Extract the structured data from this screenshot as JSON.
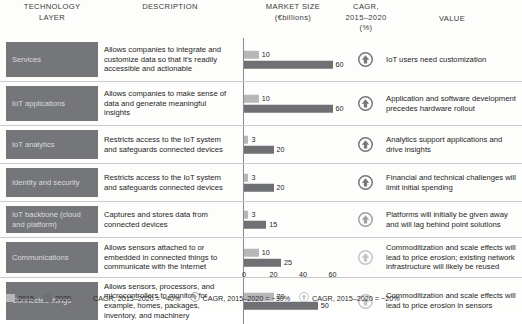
{
  "headers": {
    "layer": "TECHNOLOGY",
    "layer_sub": "LAYER",
    "description": "DESCRIPTION",
    "market": "MARKET SIZE",
    "market_sub": "(€billions)",
    "cagr": "CAGR,",
    "cagr_sub1": "2015–2020",
    "cagr_sub2": "(%)",
    "value": "VALUE"
  },
  "axis": {
    "ticks": [
      "0",
      "20",
      "40",
      "60"
    ],
    "max": 65
  },
  "legend": {
    "y2015": "2015",
    "y2020": "2020",
    "cagr40": "CAGR, 2015–2020 = ~40%",
    "cagr30": "CAGR, 2015–2020 = ~30%",
    "cagr20": "CAGR, 2015–2020 = ~20%"
  },
  "colors": {
    "bar_2015": "#b6b7b9",
    "bar_2020": "#6f7073",
    "chip_bg": "#75767a",
    "chip_text": "#d9dadd",
    "icon_40": "#76777b",
    "icon_30": "#a0a1a4",
    "icon_20": "#c3c4c6"
  },
  "rows": [
    {
      "layer": "Services",
      "description": "Allows companies to integrate and customize data so that it's readily accessible and actionable",
      "v2015": 10,
      "v2020": 60,
      "cagr_band": 40,
      "value": "IoT users need customization"
    },
    {
      "layer": "IoT applications",
      "description": "Allows companies to make sense of data and generate meaningful insights",
      "v2015": 10,
      "v2020": 60,
      "cagr_band": 40,
      "value": "Application and software development precedes hardware rollout"
    },
    {
      "layer": "IoT analytics",
      "description": "Restricts access to the IoT system and safeguards connected devices",
      "v2015": 3,
      "v2020": 20,
      "cagr_band": 40,
      "value": "Analytics support applications and drive insights"
    },
    {
      "layer": "Identity and security",
      "description": "Restricts access to the IoT system and safeguards connected devices",
      "v2015": 3,
      "v2020": 20,
      "cagr_band": 40,
      "value": "Financial and technical challenges will limit initial spending"
    },
    {
      "layer": "IoT backbone (cloud and platform)",
      "description": "Captures and stores data from connected devices",
      "v2015": 3,
      "v2020": 15,
      "cagr_band": 30,
      "value": "Platforms will initially be given away and will lag behind point solutions"
    },
    {
      "layer": "Communications",
      "description": "Allows sensors attached to or embedded in connected things to communicate with the internet",
      "v2015": 10,
      "v2020": 25,
      "cagr_band": 20,
      "value": "Commoditization and scale effects will lead to price erosion; existing network infrastructure will likely be reused"
    },
    {
      "layer": "Connected things",
      "description": "Allows sensors, processors, and microcontrollers to monitor, for example, homes, packages, inventory, and machinery",
      "v2015": 20,
      "v2020": 50,
      "cagr_band": 20,
      "value": "Commoditization and scale effects will lead to price erosion in sensors"
    }
  ],
  "chart_data": {
    "type": "bar",
    "xlabel": "Market size (€ billions)",
    "ylabel": "Technology layer",
    "xlim": [
      0,
      65
    ],
    "xticks": [
      0,
      20,
      40,
      60
    ],
    "grid": false,
    "legend_position": "bottom-left",
    "categories": [
      "Services",
      "IoT applications",
      "IoT analytics",
      "Identity and security",
      "IoT backbone (cloud and platform)",
      "Communications",
      "Connected things"
    ],
    "series": [
      {
        "name": "2015",
        "values": [
          10,
          10,
          3,
          3,
          3,
          10,
          20
        ],
        "color": "#b6b7b9"
      },
      {
        "name": "2020",
        "values": [
          60,
          60,
          20,
          20,
          15,
          25,
          50
        ],
        "color": "#6f7073"
      }
    ],
    "annotations": {
      "cagr_2015_2020_pct": [
        40,
        40,
        40,
        40,
        30,
        20,
        20
      ]
    }
  }
}
